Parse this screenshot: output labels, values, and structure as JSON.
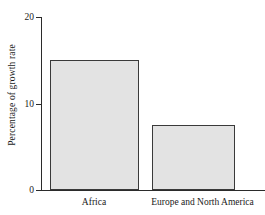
{
  "chart_data": {
    "type": "bar",
    "title": "",
    "xlabel": "",
    "ylabel": "Percentage of growth rate",
    "categories": [
      "Africa",
      "Europe and North America"
    ],
    "values": [
      15,
      7.5
    ],
    "ylim": [
      0,
      20
    ],
    "yticks": [
      "0",
      "10",
      "20"
    ],
    "grid": false,
    "legend": "none",
    "bar_fill_color": "#e3e3e3",
    "bar_border_color": "#3a3a3a",
    "axis_color": "#2b2b2b"
  }
}
